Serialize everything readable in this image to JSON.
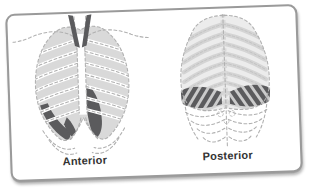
{
  "figure": {
    "type": "medical-illustration-ribcage-views",
    "panels": [
      {
        "id": "anterior",
        "label": "Anterior",
        "illustration": "ribcage-anterior-illustration"
      },
      {
        "id": "posterior",
        "label": "Posterior",
        "illustration": "ribcage-posterior-illustration"
      }
    ]
  },
  "colors": {
    "page_background": "#ffffff",
    "card_background": "#ffffff",
    "card_border": "#9a9a9a",
    "lung_shade": "#d9d9d9",
    "rib_dash": "#b0b0b0",
    "posterior_rib": "#d4d4d4",
    "dark_accent": "#5b5b5d",
    "band_bg": "#cbcbcb",
    "label_text": "#333333"
  }
}
